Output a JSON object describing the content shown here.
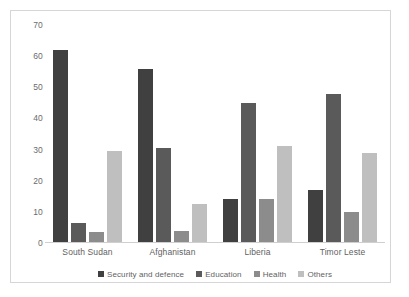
{
  "chart_data": {
    "type": "bar",
    "title": "",
    "subtitle": "",
    "xlabel": "",
    "ylabel": "",
    "categories": [
      "South Sudan",
      "Afghanistan",
      "Liberia",
      "Timor Leste"
    ],
    "series": [
      {
        "name": "Security and defence",
        "color": "#404040",
        "values": [
          62,
          56,
          14,
          17
        ]
      },
      {
        "name": "Education",
        "color": "#5a5a5a",
        "values": [
          6.5,
          30.5,
          45,
          48
        ]
      },
      {
        "name": "Health",
        "color": "#8c8c8c",
        "values": [
          3.5,
          4,
          14,
          10
        ]
      },
      {
        "name": "Others",
        "color": "#bfbfbf",
        "values": [
          29.5,
          12.5,
          31,
          29
        ]
      }
    ],
    "ylim": [
      0,
      70
    ],
    "yticks": [
      0,
      10,
      20,
      30,
      40,
      50,
      60,
      70
    ],
    "ytick_labels": [
      "0",
      "10",
      "20",
      "30",
      "40",
      "50",
      "60",
      "70"
    ],
    "grid": false,
    "legend_position": "bottom",
    "annotations": []
  },
  "legend": {
    "items": [
      {
        "label": "Security and defence",
        "color": "#404040"
      },
      {
        "label": "Education",
        "color": "#5a5a5a"
      },
      {
        "label": "Health",
        "color": "#8c8c8c"
      },
      {
        "label": "Others",
        "color": "#bfbfbf"
      }
    ]
  },
  "colors": {
    "frame_border": "#d6d6d6",
    "axis_line": "#cfcfcf",
    "tick_text": "#6b6b6b",
    "label_text": "#5f5f5f",
    "background": "#ffffff"
  }
}
